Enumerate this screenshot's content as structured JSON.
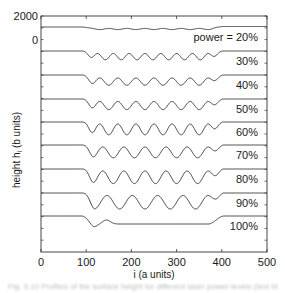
{
  "chart_data": {
    "type": "line",
    "title": "",
    "xlabel": "i (a units)",
    "ylabel": "height h_i (b units)",
    "xlim": [
      0,
      500
    ],
    "x_ticks": [
      0,
      100,
      200,
      300,
      400,
      500
    ],
    "y_tick_labels": [
      {
        "value": 2000,
        "label": "2000"
      },
      {
        "value": 0,
        "label": "0"
      }
    ],
    "y_tick_spacing": 1000,
    "grid": false,
    "legend": "inline labels at right of each curve",
    "layout": "stacked (waterfall) profiles, each offset downward by ~2000 b units",
    "series": [
      {
        "name": "power = 20%",
        "label": "power = 20%",
        "offset_px": 27,
        "shape": "flat with shallow dip 100-380, small ripple",
        "amp": 1.5,
        "periods": 0,
        "dip": 2,
        "ripple": 0.6,
        "ripple_period": 40
      },
      {
        "name": "30%",
        "label": "30%",
        "offset_px": 51,
        "shape": "sinusoidal, 8 short waves",
        "amp": 3.5,
        "periods": 8,
        "dip": 6
      },
      {
        "name": "40%",
        "label": "40%",
        "offset_px": 75,
        "shape": "sinusoidal, 7 waves",
        "amp": 4,
        "periods": 7,
        "dip": 7
      },
      {
        "name": "50%",
        "label": "50%",
        "offset_px": 99,
        "shape": "sinusoidal, 7 waves",
        "amp": 4.5,
        "periods": 7,
        "dip": 7
      },
      {
        "name": "60%",
        "label": "60%",
        "offset_px": 122,
        "shape": "sinusoidal, 7 waves",
        "amp": 6,
        "periods": 7,
        "dip": 8
      },
      {
        "name": "70%",
        "label": "70%",
        "offset_px": 145,
        "shape": "sinusoidal, 6 waves",
        "amp": 6,
        "periods": 6,
        "dip": 8
      },
      {
        "name": "80%",
        "label": "80%",
        "offset_px": 169,
        "shape": "sinusoidal, 6 waves",
        "amp": 7,
        "periods": 6,
        "dip": 9
      },
      {
        "name": "90%",
        "label": "90%",
        "offset_px": 193,
        "shape": "sinusoidal, 5 large waves",
        "amp": 7.5,
        "periods": 5,
        "dip": 10
      },
      {
        "name": "100%",
        "label": "100%",
        "offset_px": 216,
        "shape": "single dip ~110 then flat trough, rise at ~380",
        "amp": 0,
        "periods": 0,
        "dip": 10
      }
    ],
    "transition": {
      "drop_start": 90,
      "drop_end": 120,
      "rise_start": 370,
      "rise_end": 405
    }
  },
  "caption": "Fig. 3.10  Profiles of the surface height for different laser power levels (text blurred)"
}
